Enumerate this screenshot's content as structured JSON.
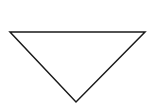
{
  "diagram": {
    "shape": "inverted-triangle",
    "stroke_color": "#1a1a1a",
    "fill_color": "#ffffff",
    "background": "#ffffff",
    "stroke_width": 1.5,
    "points": "10,32 145,32 76,102"
  }
}
